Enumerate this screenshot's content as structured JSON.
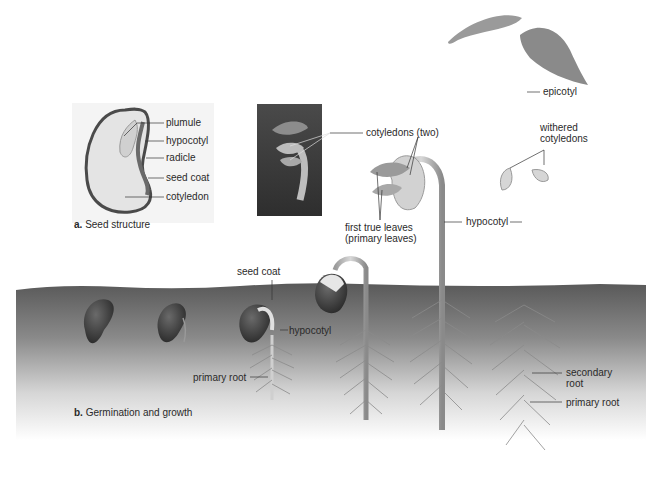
{
  "panel_a": {
    "caption_letter": "a.",
    "caption_text": "Seed structure",
    "labels": {
      "plumule": "plumule",
      "hypocotyl": "hypocotyl",
      "radicle": "radicle",
      "seed_coat": "seed coat",
      "cotyledon": "cotyledon"
    }
  },
  "panel_b": {
    "caption_letter": "b.",
    "caption_text": "Germination and growth",
    "labels": {
      "seed_coat": "seed coat",
      "hypocotyl_small": "hypocotyl",
      "primary_root_small": "primary root",
      "cotyledons_two": "cotyledons (two)",
      "first_true_leaves_1": "first true leaves",
      "first_true_leaves_2": "(primary leaves)",
      "hypocotyl_large": "hypocotyl",
      "epicotyl": "epicotyl",
      "withered_1": "withered",
      "withered_2": "cotyledons",
      "secondary_root_1": "secondary",
      "secondary_root_2": "root",
      "primary_root_large": "primary root"
    }
  },
  "colors": {
    "soil_dark": "#5e5e5e",
    "soil_light": "#f2f2f2",
    "seed_dark": "#3d3d3d",
    "plant": "#b8b8b8",
    "leaf": "#8f8f8f",
    "label_text": "#2a2a2a"
  }
}
